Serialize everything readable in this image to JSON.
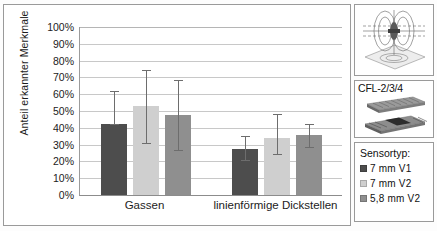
{
  "chart_data": {
    "type": "bar",
    "title": "",
    "xlabel": "",
    "ylabel": "Anteil erkannter Merkmale",
    "ylim": [
      0,
      100
    ],
    "ytick_labels": [
      "100%",
      "90%",
      "80%",
      "70%",
      "60%",
      "50%",
      "40%",
      "30%",
      "20%",
      "10%",
      "0%"
    ],
    "ytick_values": [
      100,
      90,
      80,
      70,
      60,
      50,
      40,
      30,
      20,
      10,
      0
    ],
    "grid": true,
    "legend_position": "right-panel",
    "categories": [
      "Gassen",
      "linienförmige Dickstellen"
    ],
    "series": [
      {
        "name": "7 mm V1",
        "color": "#4d4d4d",
        "values": [
          42.5,
          27.5
        ],
        "err_low": [
          42.5,
          21.0
        ],
        "err_high": [
          62.0,
          35.0
        ]
      },
      {
        "name": "7 mm V2",
        "color": "#cfcfcf",
        "values": [
          53.0,
          34.0
        ],
        "err_low": [
          31.0,
          24.5
        ],
        "err_high": [
          74.5,
          48.0
        ]
      },
      {
        "name": "5,8 mm V2",
        "color": "#8f8f8f",
        "values": [
          47.5,
          35.5
        ],
        "err_low": [
          27.0,
          28.5
        ],
        "err_high": [
          68.5,
          42.5
        ]
      }
    ]
  },
  "chart": {
    "axis_color": "#8c8c8c",
    "grid_color": "#c8c8c8",
    "error_bar_color": "#6d6d6d"
  },
  "side_panels": {
    "sensor_image": {
      "name": "eddy-current-field-illustration",
      "caption": ""
    },
    "cfl_panel": {
      "title": "CFL-2/3/4",
      "image_name": "composite-laminate-stack-illustration"
    },
    "legend": {
      "title": "Sensortyp:",
      "items": [
        {
          "label": "7 mm V1",
          "color": "#4d4d4d"
        },
        {
          "label": "7 mm V2",
          "color": "#cfcfcf"
        },
        {
          "label": "5,8 mm V2",
          "color": "#8f8f8f"
        }
      ]
    }
  }
}
